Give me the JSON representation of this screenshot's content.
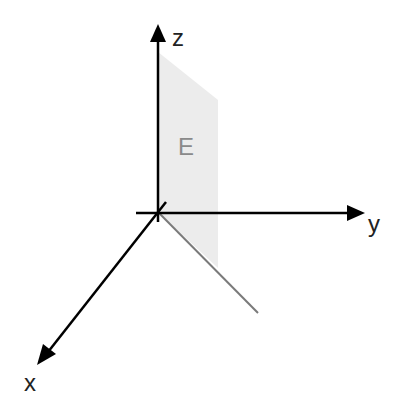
{
  "diagram": {
    "type": "3d-coordinate-axes",
    "axes": {
      "z": {
        "label": "z"
      },
      "y": {
        "label": "y"
      },
      "x": {
        "label": "x"
      }
    },
    "plane": {
      "label": "E",
      "fill": "#ececec",
      "label_color": "#8a8a8a"
    },
    "colors": {
      "axis": "#000000",
      "projection_line": "#7a7a7a",
      "background": "#ffffff"
    }
  }
}
